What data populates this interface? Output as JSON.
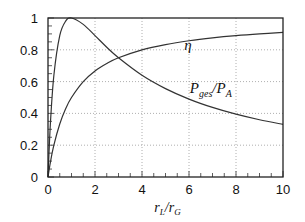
{
  "chart_data": {
    "type": "line",
    "title": "",
    "xlabel": "r_L / r_G",
    "xlabel_parts": {
      "main1": "r",
      "sub1": "L",
      "slash": "/",
      "main2": "r",
      "sub2": "G"
    },
    "ylabel": "",
    "xlim": [
      0,
      10
    ],
    "ylim": [
      0,
      1
    ],
    "xticks": [
      0,
      2,
      4,
      6,
      8,
      10
    ],
    "xtick_labels": [
      "0",
      "2",
      "4",
      "6",
      "8",
      "10"
    ],
    "yticks": [
      0,
      0.2,
      0.4,
      0.6,
      0.8,
      1
    ],
    "ytick_labels": [
      "0",
      "0.2",
      "0.4",
      "0.6",
      "0.8",
      "1"
    ],
    "x_minor_step": 0.5,
    "y_minor_step": 0.05,
    "grid": true,
    "grid_style": "dotted",
    "legend": "none (inline curve labels)",
    "series": [
      {
        "name": "eta",
        "label": "η",
        "formula": "x/(1+x)",
        "x": [
          0,
          0.1,
          0.25,
          0.5,
          0.75,
          1,
          1.5,
          2,
          2.5,
          3,
          4,
          5,
          6,
          7,
          8,
          9,
          10
        ],
        "y": [
          0,
          0.091,
          0.2,
          0.333,
          0.429,
          0.5,
          0.6,
          0.667,
          0.714,
          0.75,
          0.8,
          0.833,
          0.857,
          0.875,
          0.889,
          0.9,
          0.909
        ],
        "label_at": [
          5.8,
          0.83
        ]
      },
      {
        "name": "P_ges/P_A",
        "label_parts": {
          "main1": "P",
          "sub1": "ges",
          "slash": "/",
          "main2": "P",
          "sub2": "A"
        },
        "formula": "4x/(1+x)^2",
        "x": [
          0,
          0.1,
          0.25,
          0.5,
          0.75,
          1,
          1.5,
          2,
          2.5,
          3,
          4,
          5,
          6,
          7,
          8,
          9,
          10
        ],
        "y": [
          0,
          0.331,
          0.64,
          0.889,
          0.98,
          1,
          0.96,
          0.889,
          0.816,
          0.75,
          0.64,
          0.556,
          0.49,
          0.4375,
          0.395,
          0.36,
          0.331
        ],
        "label_at": [
          6.8,
          0.56
        ]
      }
    ]
  }
}
